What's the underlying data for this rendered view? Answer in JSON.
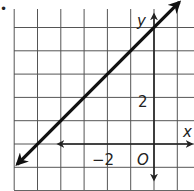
{
  "problem_marker": "•",
  "chart_data": {
    "type": "line",
    "title": "",
    "xlabel": "x",
    "ylabel": "y",
    "origin_label": "O",
    "tick_labels": {
      "x": [
        "−2"
      ],
      "y": [
        "2"
      ]
    },
    "xlim": [
      -6,
      1.6
    ],
    "ylim": [
      -2,
      6
    ],
    "grid": true,
    "grid_step": 1,
    "series": [
      {
        "name": "line",
        "equation": "y = x + 5",
        "x": [
          -6,
          -5,
          0,
          1
        ],
        "values": [
          -1,
          0,
          5,
          6
        ]
      }
    ],
    "colors": {
      "grid": "#555555",
      "axis": "#222222",
      "line": "#111111"
    }
  }
}
